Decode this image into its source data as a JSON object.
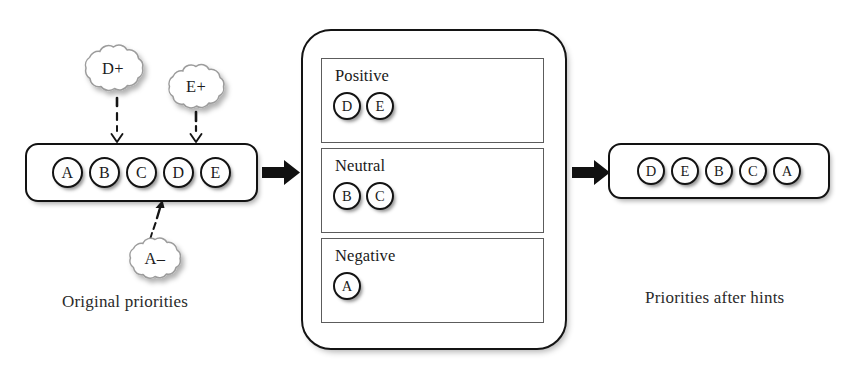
{
  "figure": {
    "type": "flow-diagram",
    "title_text_present": false
  },
  "left_panel": {
    "name": "original-priority-list",
    "caption": "Original priorities",
    "tokens": [
      "A",
      "B",
      "C",
      "D",
      "E"
    ]
  },
  "hints": [
    {
      "label": "D+",
      "target_token": "D",
      "polarity": "positive"
    },
    {
      "label": "E+",
      "target_token": "E",
      "polarity": "positive"
    },
    {
      "label": "A–",
      "target_token": "A",
      "polarity": "negative"
    }
  ],
  "sorter": {
    "name": "hint-sorter",
    "bins": [
      {
        "label": "Positive",
        "tokens": [
          "D",
          "E"
        ]
      },
      {
        "label": "Neutral",
        "tokens": [
          "B",
          "C"
        ]
      },
      {
        "label": "Negative",
        "tokens": [
          "A"
        ]
      }
    ]
  },
  "right_panel": {
    "name": "reordered-priority-list",
    "caption": "Priorities after hints",
    "tokens": [
      "D",
      "E",
      "B",
      "C",
      "A"
    ]
  },
  "flow_arrows": [
    {
      "from": "original-priority-list",
      "to": "hint-sorter"
    },
    {
      "from": "hint-sorter",
      "to": "reordered-priority-list"
    }
  ],
  "colors": {
    "ink": "#131313",
    "bin_border": "#5c5c5c",
    "cloud_stroke": "#9a9a9a",
    "background": "#ffffff"
  }
}
